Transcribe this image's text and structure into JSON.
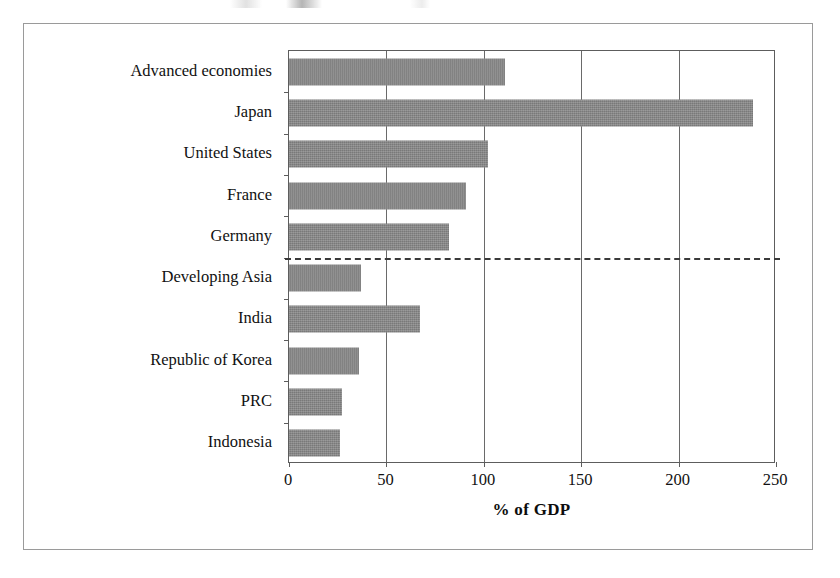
{
  "chart_data": {
    "type": "bar",
    "orientation": "horizontal",
    "title": "",
    "xlabel": "% of GDP",
    "ylabel": "",
    "xlim": [
      0,
      250
    ],
    "xticks": [
      "0",
      "50",
      "100",
      "150",
      "200",
      "250"
    ],
    "grid": true,
    "legend": null,
    "categories": [
      "Advanced economies",
      "Japan",
      "United States",
      "France",
      "Germany",
      "Developing Asia",
      "India",
      "Republic of Korea",
      "PRC",
      "Indonesia"
    ],
    "values": [
      111,
      238,
      102,
      91,
      82,
      37,
      67,
      36,
      27,
      26
    ],
    "annotations": [
      {
        "type": "dashed-separator",
        "after_category": "Germany",
        "note": "dashed horizontal line separating advanced economies group from developing Asia group"
      }
    ]
  },
  "style": {
    "bar_fill": "#858585",
    "axis_color": "#5d5d5d",
    "frame_color": "#9a9a9a",
    "text_color": "#111111",
    "divider_color": "#3a3a3a",
    "background": "#ffffff"
  }
}
